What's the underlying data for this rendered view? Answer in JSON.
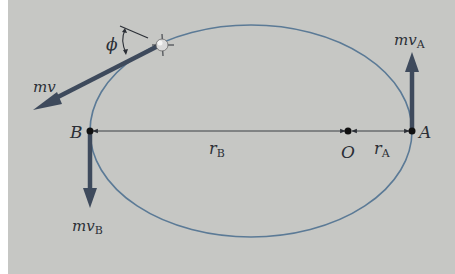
{
  "figure": {
    "background": "#c6c7c4",
    "orbit_color": "#5b7a96",
    "vector_color": "#3e4a5c",
    "labels": {
      "momentum_general": "mv",
      "angle": "ϕ",
      "momentum_A": "mv",
      "momentum_A_sub": "A",
      "momentum_B": "mv",
      "momentum_B_sub": "B",
      "point_A": "A",
      "point_B": "B",
      "focus_O": "O",
      "radius_A": "r",
      "radius_A_sub": "A",
      "radius_B": "r",
      "radius_B_sub": "B"
    }
  }
}
